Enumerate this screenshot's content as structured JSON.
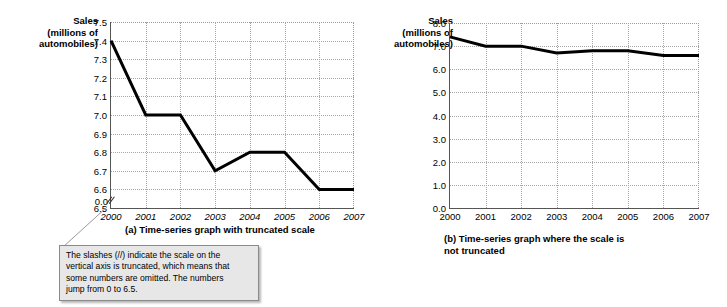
{
  "chart_data": [
    {
      "id": "a",
      "type": "line",
      "title": "(a) Time-series graph with truncated scale",
      "ylabel": "Sales (millions of automobiles)",
      "ylabel_lines": [
        "Sales",
        "(millions of",
        "automobiles)"
      ],
      "xlabel": "",
      "categories": [
        "2000",
        "2001",
        "2002",
        "2003",
        "2004",
        "2005",
        "2006",
        "2007"
      ],
      "values": [
        7.4,
        7.0,
        7.0,
        6.7,
        6.8,
        6.8,
        6.6,
        6.6
      ],
      "yticks": [
        "7.5",
        "7.4",
        "7.3",
        "7.2",
        "7.1",
        "7.0",
        "6.9",
        "6.8",
        "6.7",
        "6.6",
        "6.5",
        "0.0"
      ],
      "ytick_values": [
        7.5,
        7.4,
        7.3,
        7.2,
        7.1,
        7.0,
        6.9,
        6.8,
        6.7,
        6.6,
        6.5,
        0.0
      ],
      "ylim": [
        6.5,
        7.5
      ],
      "axis_truncated": true,
      "truncation_glyph": "//",
      "grid": true,
      "legend": "none",
      "line_color": "#000000"
    },
    {
      "id": "b",
      "type": "line",
      "title": "(b) Time-series graph where the scale is not truncated",
      "title_lines": [
        "(b) Time-series graph where the scale is",
        "not truncated"
      ],
      "ylabel": "Sales (millions of automobiles)",
      "ylabel_lines": [
        "Sales",
        "(millions of",
        "automobiles)"
      ],
      "xlabel": "",
      "categories": [
        "2000",
        "2001",
        "2002",
        "2003",
        "2004",
        "2005",
        "2006",
        "2007"
      ],
      "values": [
        7.4,
        7.0,
        7.0,
        6.7,
        6.8,
        6.8,
        6.6,
        6.6
      ],
      "yticks": [
        "8.0",
        "7.0",
        "6.0",
        "5.0",
        "4.0",
        "3.0",
        "2.0",
        "1.0",
        "0.0"
      ],
      "ytick_values": [
        8.0,
        7.0,
        6.0,
        5.0,
        4.0,
        3.0,
        2.0,
        1.0,
        0.0
      ],
      "ylim": [
        0.0,
        8.0
      ],
      "axis_truncated": false,
      "grid": true,
      "legend": "none",
      "line_color": "#000000"
    }
  ],
  "callout": {
    "lines": [
      "The slashes (//) indicate the scale on the",
      "vertical axis is truncated, which means that",
      "some numbers are omitted.  The numbers",
      "jump from 0 to 6.5."
    ],
    "background_color": "#e7e7e7",
    "border_color": "#8a8a8a"
  },
  "colors": {
    "line": "#000000",
    "grid": "#a8a8a8",
    "axis": "#555555",
    "page_background": "#ffffff"
  }
}
